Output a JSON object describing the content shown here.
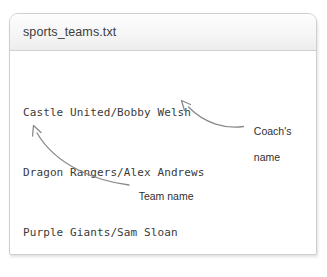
{
  "window": {
    "title": "sports_teams.txt"
  },
  "document": {
    "lines": [
      "Castle United/Bobby Welsh",
      "Dragon Rangers/Alex Andrews",
      "Purple Giants/Sam Sloan"
    ]
  },
  "annotations": [
    {
      "id": "coach",
      "label_line1": "Coach's",
      "label_line2": "name",
      "points_to": "Alex Andrews",
      "arrow_color": "#8a8a8a"
    },
    {
      "id": "team",
      "label_line1": "Team name",
      "label_line2": "",
      "points_to": "Purple Giants",
      "arrow_color": "#8a8a8a"
    }
  ],
  "colors": {
    "page_background": "#ffffff",
    "window_border": "#cfcfcf",
    "titlebar_top": "#fdfdfd",
    "titlebar_bottom": "#ededed",
    "title_text": "#3c3c3c",
    "body_text": "#3a3a3a",
    "annotation_text": "#2f2f2f",
    "arrow_stroke": "#8a8a8a"
  }
}
